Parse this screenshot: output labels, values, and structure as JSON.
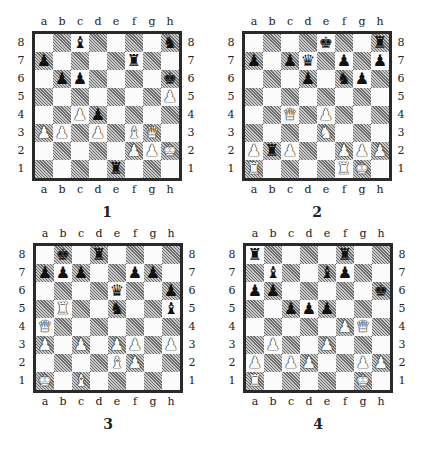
{
  "files": [
    "a",
    "b",
    "c",
    "d",
    "e",
    "f",
    "g",
    "h"
  ],
  "ranks": [
    "8",
    "7",
    "6",
    "5",
    "4",
    "3",
    "2",
    "1"
  ],
  "glyphs": {
    "K": "♚",
    "Q": "♛",
    "R": "♜",
    "B": "♝",
    "N": "♞",
    "P": "♟"
  },
  "diagrams": [
    {
      "number": "1",
      "pieces": {
        "c8": "bB",
        "h8": "bN",
        "a7": "bP",
        "f7": "bR",
        "b6": "bP",
        "c6": "bP",
        "h6": "bK",
        "h5": "wP",
        "c4": "wP",
        "d4": "bP",
        "a3": "wP",
        "b3": "wP",
        "d3": "wP",
        "f3": "wB",
        "g3": "wQ",
        "f2": "wP",
        "g2": "wP",
        "h2": "wK",
        "e1": "bR"
      }
    },
    {
      "number": "2",
      "pieces": {
        "e8": "bK",
        "h8": "bR",
        "a7": "bP",
        "c7": "bP",
        "d7": "bQ",
        "f7": "bP",
        "h7": "bP",
        "d6": "bP",
        "f6": "bN",
        "g6": "bP",
        "c4": "wQ",
        "e4": "wP",
        "e3": "wN",
        "a2": "wP",
        "b2": "bR",
        "c2": "wP",
        "f2": "wP",
        "g2": "wP",
        "h2": "wP",
        "a1": "wR",
        "f1": "wR",
        "g1": "wK"
      }
    },
    {
      "number": "3",
      "pieces": {
        "b8": "bK",
        "d8": "bR",
        "a7": "bP",
        "b7": "bP",
        "c7": "bP",
        "f7": "bP",
        "g7": "bP",
        "e6": "bQ",
        "h6": "bP",
        "b5": "wR",
        "e5": "bN",
        "h5": "bB",
        "a4": "wQ",
        "a3": "wP",
        "c3": "wP",
        "e3": "wP",
        "f3": "wP",
        "h3": "wP",
        "e2": "wB",
        "f2": "wP",
        "a1": "wK",
        "c1": "wB"
      }
    },
    {
      "number": "4",
      "pieces": {
        "a8": "bR",
        "f8": "bR",
        "b7": "bB",
        "e7": "bB",
        "f7": "bP",
        "a6": "bP",
        "b6": "bP",
        "h6": "bK",
        "c5": "bP",
        "d5": "bP",
        "e5": "bP",
        "f4": "wP",
        "g4": "wQ",
        "b3": "wP",
        "e3": "wP",
        "a2": "wP",
        "c2": "wP",
        "d2": "wP",
        "g2": "wP",
        "h2": "wP",
        "a1": "wR",
        "g1": "wK"
      }
    }
  ]
}
